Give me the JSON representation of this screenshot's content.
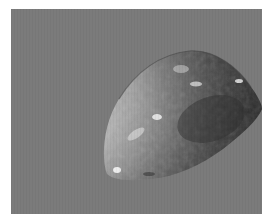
{
  "image": {
    "subject": "grayscale photograph of an irregular teardrop-shaped planetary body (moon/asteroid) against a flat gray background",
    "colors": {
      "border": "#ffffff",
      "background": "#7b7b7b",
      "lit_surface": "#d2d2d2",
      "mid_surface": "#9a9a9a",
      "shadow_surface": "#3e3e3e"
    }
  }
}
